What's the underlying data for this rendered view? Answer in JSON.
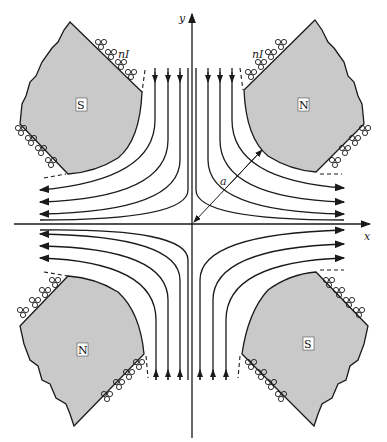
{
  "figure": {
    "axes": {
      "x_label": "x",
      "y_label": "y"
    },
    "dimension_label": "a",
    "coil_label": "nI",
    "poles": [
      {
        "id": "top-left",
        "label": "S"
      },
      {
        "id": "top-right",
        "label": "N"
      },
      {
        "id": "bottom-left",
        "label": "N"
      },
      {
        "id": "bottom-right",
        "label": "S"
      }
    ],
    "field_lines_per_quadrant": 4,
    "colors": {
      "pole_fill": "#c9c9c9",
      "line": "#1a1a1a",
      "background": "#ffffff"
    }
  }
}
